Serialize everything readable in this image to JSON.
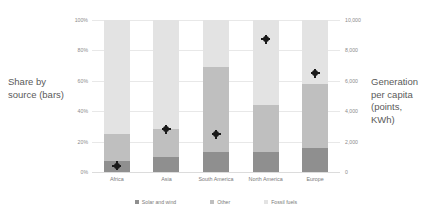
{
  "chart_data": {
    "type": "bar",
    "title": "",
    "categories": [
      "Africa",
      "Asia",
      "South America",
      "North America",
      "Europe"
    ],
    "series": [
      {
        "name": "Solar and wind",
        "values": [
          7,
          10,
          13,
          13,
          16
        ],
        "color": "#8f8f8f"
      },
      {
        "name": "Other",
        "values": [
          18,
          18,
          56,
          31,
          42
        ],
        "color": "#bfbfbf"
      },
      {
        "name": "Fossil fuels",
        "values": [
          75,
          72,
          31,
          56,
          42
        ],
        "color": "#e3e3e3"
      }
    ],
    "markers": {
      "name": "Generation per capita",
      "values": [
        400,
        2800,
        2500,
        8750,
        6500
      ],
      "color": "#1a1a1a"
    },
    "left_axis": {
      "label": "Share by source (bars)",
      "ticks": [
        "0%",
        "20%",
        "40%",
        "60%",
        "80%",
        "100%"
      ],
      "lim": [
        0,
        100
      ]
    },
    "right_axis": {
      "label": "Generation per capita (points, KWh)",
      "ticks": [
        "0",
        "2,000",
        "4,000",
        "6,000",
        "8,000",
        "10,000"
      ],
      "lim": [
        0,
        10000
      ]
    },
    "xlabel": "",
    "grid": true,
    "legend_position": "bottom"
  },
  "axis_titles": {
    "left": "Share by source (bars)",
    "right": "Generation per capita (points, KWh)"
  },
  "left_ticks": [
    "100%",
    "80%",
    "60%",
    "40%",
    "20%",
    "0%"
  ],
  "right_ticks": [
    "10,000",
    "8,000",
    "6,000",
    "4,000",
    "2,000",
    "0"
  ],
  "legend": [
    {
      "label": "Solar and wind",
      "color": "#8f8f8f"
    },
    {
      "label": "Other",
      "color": "#bfbfbf"
    },
    {
      "label": "Fossil fuels",
      "color": "#e3e3e3"
    }
  ]
}
